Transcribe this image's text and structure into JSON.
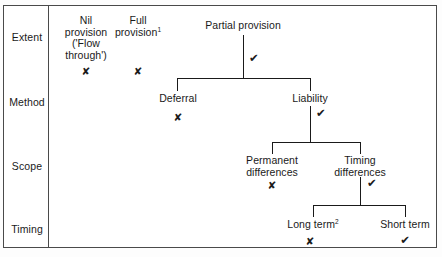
{
  "diagram": {
    "rows": [
      {
        "id": "extent",
        "label": "Extent"
      },
      {
        "id": "method",
        "label": "Method"
      },
      {
        "id": "scope",
        "label": "Scope"
      },
      {
        "id": "timing",
        "label": "Timing"
      }
    ],
    "nodes": [
      {
        "id": "nil-provision",
        "row": "extent",
        "lines": [
          "Nil",
          "provision",
          "('Flow",
          "through')"
        ],
        "mark": "cross",
        "mark_glyph": "✘"
      },
      {
        "id": "full-provision",
        "row": "extent",
        "lines": [
          "Full",
          "provision"
        ],
        "superscript": "1",
        "mark": "cross",
        "mark_glyph": "✘"
      },
      {
        "id": "partial-provision",
        "row": "extent",
        "lines": [
          "Partial provision"
        ],
        "mark": "tick",
        "mark_glyph": "✔"
      },
      {
        "id": "deferral",
        "row": "method",
        "lines": [
          "Deferral"
        ],
        "mark": "cross",
        "mark_glyph": "✘"
      },
      {
        "id": "liability",
        "row": "method",
        "lines": [
          "Liability"
        ],
        "mark": "tick",
        "mark_glyph": "✔"
      },
      {
        "id": "permanent-differences",
        "row": "scope",
        "lines": [
          "Permanent",
          "differences"
        ],
        "mark": "cross",
        "mark_glyph": "✘"
      },
      {
        "id": "timing-differences",
        "row": "scope",
        "lines": [
          "Timing",
          "differences"
        ],
        "mark": "tick",
        "mark_glyph": "✔"
      },
      {
        "id": "long-term",
        "row": "timing",
        "lines": [
          "Long term"
        ],
        "superscript": "2",
        "mark": "cross",
        "mark_glyph": "✘"
      },
      {
        "id": "short-term",
        "row": "timing",
        "lines": [
          "Short term"
        ],
        "mark": "tick",
        "mark_glyph": "✔"
      }
    ],
    "edges": [
      {
        "from": "partial-provision",
        "to": [
          "deferral",
          "liability"
        ]
      },
      {
        "from": "liability",
        "to": [
          "permanent-differences",
          "timing-differences"
        ]
      },
      {
        "from": "timing-differences",
        "to": [
          "long-term",
          "short-term"
        ]
      }
    ],
    "colors": {
      "line": "#1a1a1a",
      "frame": "#4a4a4a",
      "text": "#1a1a1a",
      "background": "#ffffff"
    }
  }
}
